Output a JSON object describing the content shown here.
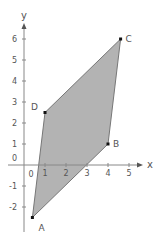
{
  "chart_data": {
    "type": "scatter",
    "title": "",
    "xlabel": "x",
    "ylabel": "y",
    "xlim": [
      -0.5,
      5.5
    ],
    "ylim": [
      -3,
      6.5
    ],
    "grid": false,
    "x_ticks": [
      "1",
      "2",
      "3",
      "4",
      "5"
    ],
    "y_ticks": [
      "-2",
      "-1",
      "1",
      "2",
      "3",
      "4",
      "5",
      "6"
    ],
    "origin_label": "0",
    "points": [
      {
        "label": "A",
        "x": 0.4,
        "y": -2.5
      },
      {
        "label": "B",
        "x": 4,
        "y": 1
      },
      {
        "label": "C",
        "x": 4.6,
        "y": 6
      },
      {
        "label": "D",
        "x": 1,
        "y": 2.5
      }
    ],
    "polygon": [
      "A",
      "B",
      "C",
      "D"
    ],
    "fill_color": "#b3b3b3",
    "edge_color": "#777777",
    "axis_color": "#888888"
  }
}
